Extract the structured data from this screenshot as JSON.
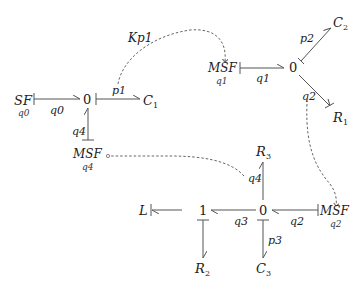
{
  "diagram": {
    "type": "bond-graph",
    "nodes": {
      "SF": {
        "label": "SF",
        "sub": "q0"
      },
      "J0a": {
        "label": "0"
      },
      "C1": {
        "label": "C",
        "sub": "1"
      },
      "MSF4": {
        "label": "MSF",
        "sub": "q4"
      },
      "MSF1": {
        "label": "MSF",
        "sub": "q1"
      },
      "J0b": {
        "label": "0"
      },
      "C2": {
        "label": "C",
        "sub": "2"
      },
      "R1": {
        "label": "R",
        "sub": "1"
      },
      "R3": {
        "label": "R",
        "sub": "3"
      },
      "J0c": {
        "label": "0"
      },
      "J1": {
        "label": "1"
      },
      "L": {
        "label": "L"
      },
      "R2": {
        "label": "R",
        "sub": "2"
      },
      "C3": {
        "label": "C",
        "sub": "3"
      },
      "MSF2": {
        "label": "MSF",
        "sub": "q2"
      }
    },
    "edge_labels": {
      "q0": "q0",
      "p1": "p1",
      "q4_left": "q4",
      "Kp1": "Kp1",
      "q1": "q1",
      "p2": "p2",
      "q2_top": "q2",
      "q4_mid": "q4",
      "q3": "q3",
      "q2_bottom": "q2",
      "p3": "p3"
    }
  }
}
